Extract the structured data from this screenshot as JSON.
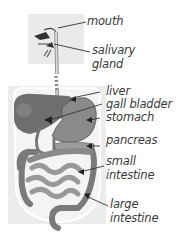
{
  "diagram": {
    "type": "anatomy-labeled-illustration",
    "colors": {
      "background_panel": "#e9e9e9",
      "body_outline": "#ffffff",
      "liver": "#6e6e6e",
      "stomach": "#8a8a8a",
      "intestine": "#9a9a9a",
      "esophagus": "#bcbcbc",
      "label_text": "#3a3a3a",
      "leader_line": "#333333"
    },
    "labels": {
      "mouth": "mouth",
      "salivary_line1": "salivary",
      "salivary_line2": "gland",
      "liver": "liver",
      "gall_bladder": "gall bladder",
      "stomach": "stomach",
      "pancreas": "pancreas",
      "small_intestine_line1": "small",
      "small_intestine_line2": "intestine",
      "large_intestine_line1": "large",
      "large_intestine_line2": "intestine"
    }
  }
}
